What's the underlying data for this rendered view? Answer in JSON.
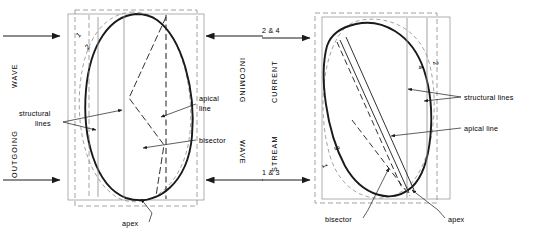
{
  "figure": {
    "stroke_color": "#1a1a1a",
    "light_stroke_color": "#8c8c8c",
    "background": "#ffffff"
  },
  "left_panel": {
    "name": "wave-panel",
    "flow_labels": [
      {
        "id": "outgoing-wave",
        "line1": "WAVE",
        "line2": "OUTGOING",
        "orientation": "rotated-ccw"
      },
      {
        "id": "incoming-wave",
        "line1": "INCOMING",
        "line2": "WAVE",
        "orientation": "rotated-cw"
      }
    ],
    "arrows": [
      {
        "id": "arrow-outgoing-top",
        "direction": "right"
      },
      {
        "id": "arrow-outgoing-bottom",
        "direction": "right"
      },
      {
        "id": "arrow-incoming-top",
        "direction": "left"
      },
      {
        "id": "arrow-incoming-bottom",
        "direction": "left"
      }
    ],
    "curve_numbers": [
      {
        "id": "curve-number-1",
        "value": "1"
      },
      {
        "id": "curve-number-2",
        "value": "2"
      }
    ],
    "callouts": [
      {
        "id": "structural-lines",
        "line1": "structural",
        "line2": "lines"
      },
      {
        "id": "apical-line",
        "line1": "apical",
        "line2": "line"
      },
      {
        "id": "bisector",
        "line1": "bisector",
        "line2": ""
      },
      {
        "id": "apex",
        "line1": "apex",
        "line2": ""
      }
    ]
  },
  "right_panel": {
    "name": "current-panel",
    "flow_labels": [
      {
        "id": "current-stream",
        "line1": "CURRENT",
        "line2": "STREAM",
        "orientation": "rotated-ccw"
      }
    ],
    "direction_tags": [
      {
        "id": "direction-2-and-4",
        "value": "2 & 4"
      },
      {
        "id": "direction-1-and-3",
        "value": "1 & 3"
      }
    ],
    "arrows": [
      {
        "id": "arrow-current-top",
        "direction": "right"
      },
      {
        "id": "arrow-current-bottom",
        "direction": "right"
      }
    ],
    "curve_numbers": [
      {
        "id": "curve-number-1",
        "value": "1"
      },
      {
        "id": "curve-number-2",
        "value": "2"
      },
      {
        "id": "curve-number-3",
        "value": "3"
      },
      {
        "id": "curve-number-4",
        "value": "4"
      }
    ],
    "callouts": [
      {
        "id": "structural-lines",
        "line1": "structural lines",
        "line2": ""
      },
      {
        "id": "apical-line",
        "line1": "apical line",
        "line2": ""
      },
      {
        "id": "bisector",
        "line1": "bisector",
        "line2": ""
      },
      {
        "id": "apex",
        "line1": "apex",
        "line2": ""
      }
    ]
  }
}
